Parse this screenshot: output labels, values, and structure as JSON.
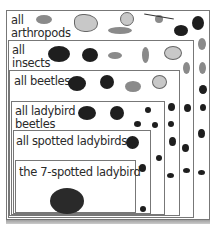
{
  "diagram": {
    "type": "nested-set",
    "levels": [
      {
        "label_line1": "all",
        "label_line2": "arthropods"
      },
      {
        "label_line1": "all",
        "label_line2": "insects"
      },
      {
        "label_line1": "all beetles"
      },
      {
        "label_line1": "all ladybird",
        "label_line2": "beetles"
      },
      {
        "label_line1": "all spotted ladybirds"
      },
      {
        "label_line1": "the 7-spotted ladybird"
      }
    ]
  }
}
